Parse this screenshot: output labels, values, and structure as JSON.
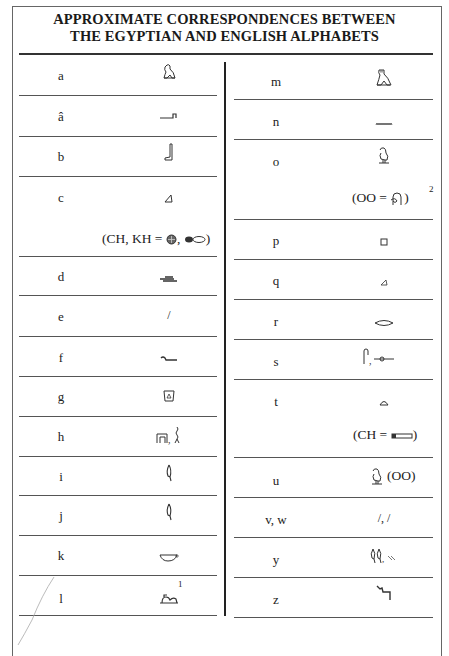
{
  "title": {
    "line1": "APPROXIMATE CORRESPONDENCES BETWEEN",
    "line2": "THE EGYPTIAN AND ENGLISH ALPHABETS"
  },
  "left_column": [
    {
      "letter": "a",
      "glyph": "vulture-icon"
    },
    {
      "letter": "â",
      "glyph": "arm-icon"
    },
    {
      "letter": "b",
      "glyph": "foot-icon"
    },
    {
      "letter": "c",
      "glyph": "hill-triangle-icon",
      "note": "(CH, KH = ",
      "note_glyphs": [
        "placenta-icon",
        "animal-belly-icon"
      ],
      "note_end": ")"
    },
    {
      "letter": "d",
      "glyph": "hand-icon"
    },
    {
      "letter": "e",
      "glyph": "reed-stroke-icon",
      "glyph_text": "/"
    },
    {
      "letter": "f",
      "glyph": "horned-viper-icon"
    },
    {
      "letter": "g",
      "glyph": "jar-stand-icon"
    },
    {
      "letter": "h",
      "glyph": "house-plan-icon",
      "glyph_extra": "twisted-flax-icon"
    },
    {
      "letter": "i",
      "glyph": "reed-leaf-icon"
    },
    {
      "letter": "j",
      "glyph": "reed-leaf-icon"
    },
    {
      "letter": "k",
      "glyph": "basket-icon"
    },
    {
      "letter": "l",
      "glyph": "lion-icon",
      "sup": "1"
    }
  ],
  "right_column": [
    {
      "letter": "m",
      "glyph": "owl-icon"
    },
    {
      "letter": "n",
      "glyph": "water-icon"
    },
    {
      "letter": "o",
      "glyph": "quail-chick-icon",
      "note": "(OO = ",
      "note_glyphs": [
        "coil-icon"
      ],
      "note_end": ")",
      "sup": "2"
    },
    {
      "letter": "p",
      "glyph": "stool-icon"
    },
    {
      "letter": "q",
      "glyph": "hill-triangle-icon"
    },
    {
      "letter": "r",
      "glyph": "mouth-icon"
    },
    {
      "letter": "s",
      "glyph": "folded-cloth-icon",
      "glyph_extra": "door-bolt-icon"
    },
    {
      "letter": "t",
      "glyph": "bread-loaf-icon",
      "note": "(CH = ",
      "note_glyphs": [
        "tethering-rope-icon"
      ],
      "note_end": ")"
    },
    {
      "letter": "u",
      "glyph": "quail-chick-icon",
      "glyph_suffix": "(OO)"
    },
    {
      "letter": "v, w",
      "glyph": "horned-viper-icon",
      "glyph_text": "/, /"
    },
    {
      "letter": "y",
      "glyph": "double-reed-icon",
      "glyph_extra": "two-strokes-icon"
    },
    {
      "letter": "z",
      "glyph": "door-bolt-z-icon"
    }
  ]
}
